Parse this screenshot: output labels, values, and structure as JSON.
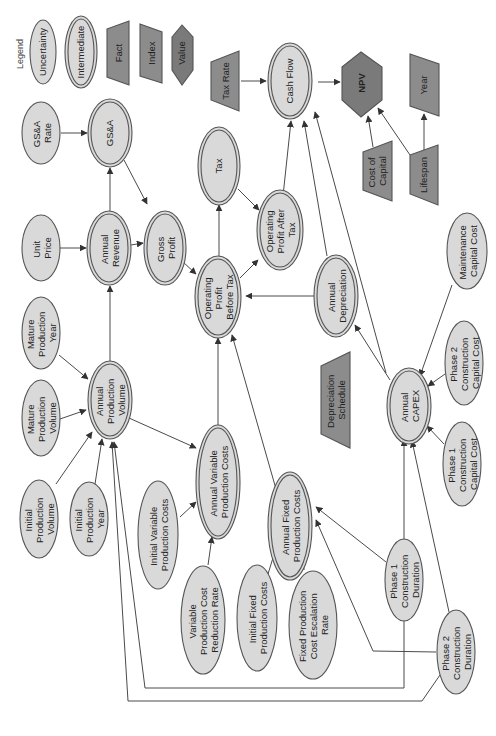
{
  "legend": {
    "title": "Legend",
    "items": [
      {
        "label": "Uncertainty",
        "shape": "ellipse"
      },
      {
        "label": "Intermediate",
        "shape": "double-ellipse"
      },
      {
        "label": "Fact",
        "shape": "trapezoid"
      },
      {
        "label": "Index",
        "shape": "parallelogram"
      },
      {
        "label": "Value",
        "shape": "hexagon"
      }
    ]
  },
  "colors": {
    "uncertainty_fill": "#d9d9d9",
    "intermediate_fill": "#d9d9d9",
    "fact_fill": "#8c8c8c",
    "value_fill": "#7a7a7a",
    "stroke": "#555555"
  },
  "orientation": "rotated-90-ccw",
  "nodes": {
    "tax_rate": {
      "lines": [
        "Tax Rate"
      ],
      "type": "fact"
    },
    "cash_flow": {
      "lines": [
        "Cash Flow"
      ],
      "type": "intermediate"
    },
    "npv": {
      "lines": [
        "NPV"
      ],
      "type": "value"
    },
    "year": {
      "lines": [
        "Year"
      ],
      "type": "index"
    },
    "gsa_rate": {
      "lines": [
        "GS&A",
        "Rate"
      ],
      "type": "uncertainty"
    },
    "gsa": {
      "lines": [
        "GS&A"
      ],
      "type": "intermediate"
    },
    "tax": {
      "lines": [
        "Tax"
      ],
      "type": "intermediate"
    },
    "cost_of_capital": {
      "lines": [
        "Cost of",
        "Capital"
      ],
      "type": "fact"
    },
    "lifespan": {
      "lines": [
        "Lifespan"
      ],
      "type": "fact"
    },
    "unit_price": {
      "lines": [
        "Unit",
        "Price"
      ],
      "type": "uncertainty"
    },
    "annual_revenue": {
      "lines": [
        "Annual",
        "Revenue"
      ],
      "type": "intermediate"
    },
    "gross_profit": {
      "lines": [
        "Gross",
        "Profit"
      ],
      "type": "intermediate"
    },
    "op_profit_before_tax": {
      "lines": [
        "Operating",
        "Profit",
        "Before Tax"
      ],
      "type": "intermediate"
    },
    "op_profit_after_tax": {
      "lines": [
        "Operating",
        "Profit After",
        "Tax"
      ],
      "type": "intermediate"
    },
    "annual_depreciation": {
      "lines": [
        "Annual",
        "Depreciation"
      ],
      "type": "intermediate"
    },
    "maintenance_capital_cost": {
      "lines": [
        "Maintenance",
        "Capital Cost"
      ],
      "type": "uncertainty"
    },
    "mature_production_year": {
      "lines": [
        "Mature",
        "Production",
        "Year"
      ],
      "type": "uncertainty"
    },
    "mature_production_volume": {
      "lines": [
        "Mature",
        "Production",
        "Volume"
      ],
      "type": "uncertainty"
    },
    "annual_production_volume": {
      "lines": [
        "Annual",
        "Production",
        "Volume"
      ],
      "type": "intermediate"
    },
    "annual_variable_production_costs": {
      "lines": [
        "Annual Variable",
        "Production Costs"
      ],
      "type": "intermediate"
    },
    "depreciation_schedule": {
      "lines": [
        "Depreciation",
        "Schedule"
      ],
      "type": "fact"
    },
    "annual_capex": {
      "lines": [
        "Annual",
        "CAPEX"
      ],
      "type": "intermediate"
    },
    "phase2_construction_capital_cost": {
      "lines": [
        "Phase 2",
        "Construction",
        "Capital Cost"
      ],
      "type": "uncertainty"
    },
    "phase1_construction_capital_cost": {
      "lines": [
        "Phase 1",
        "Construction",
        "Capital Cost"
      ],
      "type": "uncertainty"
    },
    "initial_production_volume": {
      "lines": [
        "Initial",
        "Production",
        "Volume"
      ],
      "type": "uncertainty"
    },
    "initial_production_year": {
      "lines": [
        "Initial",
        "Production",
        "Year"
      ],
      "type": "uncertainty"
    },
    "initial_variable_production_costs": {
      "lines": [
        "Initial Variable",
        "Production Costs"
      ],
      "type": "uncertainty"
    },
    "annual_fixed_production_costs": {
      "lines": [
        "Annual Fixed",
        "Production Costs"
      ],
      "type": "intermediate"
    },
    "variable_production_cost_reduction_rate": {
      "lines": [
        "Variable",
        "Production Cost",
        "Reduction Rate"
      ],
      "type": "uncertainty"
    },
    "initial_fixed_production_costs": {
      "lines": [
        "Initial Fixed",
        "Production Costs"
      ],
      "type": "uncertainty"
    },
    "fixed_production_cost_escalation_rate": {
      "lines": [
        "Fixed Production",
        "Cost Escalation",
        "Rate"
      ],
      "type": "uncertainty"
    },
    "phase1_construction_duration": {
      "lines": [
        "Phase 1",
        "Construction",
        "Duration"
      ],
      "type": "uncertainty"
    },
    "phase2_construction_duration": {
      "lines": [
        "Phase 2",
        "Construction",
        "Duration"
      ],
      "type": "uncertainty"
    }
  },
  "edges": [
    [
      "tax_rate",
      "cash_flow"
    ],
    [
      "cash_flow",
      "npv"
    ],
    [
      "cost_of_capital",
      "npv"
    ],
    [
      "lifespan",
      "npv"
    ],
    [
      "lifespan",
      "year"
    ],
    [
      "gsa_rate",
      "gsa"
    ],
    [
      "annual_revenue",
      "gsa"
    ],
    [
      "gsa",
      "gross_profit"
    ],
    [
      "unit_price",
      "annual_revenue"
    ],
    [
      "annual_revenue",
      "gross_profit"
    ],
    [
      "gross_profit",
      "op_profit_before_tax"
    ],
    [
      "op_profit_before_tax",
      "tax"
    ],
    [
      "tax",
      "op_profit_after_tax"
    ],
    [
      "op_profit_before_tax",
      "op_profit_after_tax"
    ],
    [
      "op_profit_after_tax",
      "cash_flow"
    ],
    [
      "annual_depreciation",
      "cash_flow"
    ],
    [
      "annual_capex",
      "cash_flow"
    ],
    [
      "annual_depreciation",
      "op_profit_before_tax"
    ],
    [
      "depreciation_schedule",
      "annual_depreciation"
    ],
    [
      "annual_capex",
      "annual_depreciation"
    ],
    [
      "maintenance_capital_cost",
      "annual_capex"
    ],
    [
      "phase2_construction_capital_cost",
      "annual_capex"
    ],
    [
      "phase1_construction_capital_cost",
      "annual_capex"
    ],
    [
      "phase1_construction_duration",
      "annual_capex"
    ],
    [
      "phase2_construction_duration",
      "annual_capex"
    ],
    [
      "mature_production_year",
      "annual_production_volume"
    ],
    [
      "mature_production_volume",
      "annual_production_volume"
    ],
    [
      "initial_production_volume",
      "annual_production_volume"
    ],
    [
      "initial_production_year",
      "annual_production_volume"
    ],
    [
      "phase1_construction_duration",
      "annual_production_volume"
    ],
    [
      "phase2_construction_duration",
      "annual_production_volume"
    ],
    [
      "annual_production_volume",
      "annual_revenue"
    ],
    [
      "annual_production_volume",
      "annual_variable_production_costs"
    ],
    [
      "initial_variable_production_costs",
      "annual_variable_production_costs"
    ],
    [
      "variable_production_cost_reduction_rate",
      "annual_variable_production_costs"
    ],
    [
      "annual_variable_production_costs",
      "op_profit_before_tax"
    ],
    [
      "annual_fixed_production_costs",
      "op_profit_before_tax"
    ],
    [
      "initial_fixed_production_costs",
      "annual_fixed_production_costs"
    ],
    [
      "fixed_production_cost_escalation_rate",
      "annual_fixed_production_costs"
    ],
    [
      "phase1_construction_duration",
      "annual_fixed_production_costs"
    ],
    [
      "phase2_construction_duration",
      "annual_fixed_production_costs"
    ]
  ]
}
